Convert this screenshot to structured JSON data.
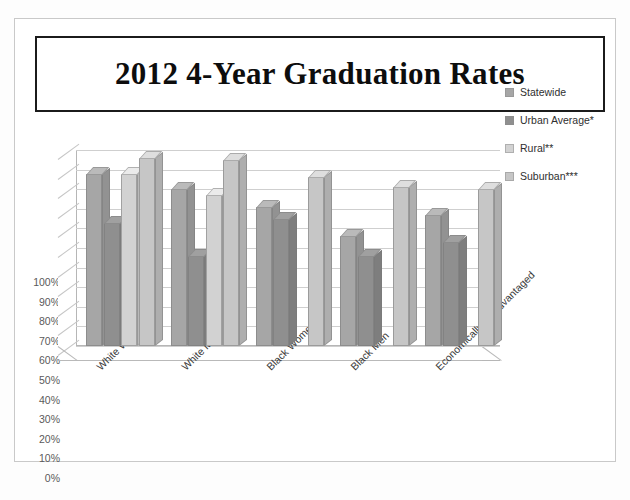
{
  "title": "2012 4-Year Graduation Rates",
  "legend": {
    "position": "right",
    "items": [
      {
        "label": "Statewide",
        "color": "#a6a6a6"
      },
      {
        "label": "Urban Average*",
        "color": "#8f8f8f"
      },
      {
        "label": "Rural**",
        "color": "#d2d2d2"
      },
      {
        "label": "Suburban***",
        "color": "#c6c6c6"
      }
    ]
  },
  "chart_data": {
    "type": "bar",
    "title": "2012 4-Year Graduation Rates",
    "xlabel": "",
    "ylabel": "",
    "ylim": [
      0,
      100
    ],
    "grid": true,
    "yticks": [
      "0%",
      "10%",
      "20%",
      "30%",
      "40%",
      "50%",
      "60%",
      "70%",
      "80%",
      "90%",
      "100%"
    ],
    "categories": [
      "White Women",
      "White Men",
      "Black Women",
      "Black Men",
      "Economically Disadvantaged"
    ],
    "series": [
      {
        "name": "Statewide",
        "color": "#a6a6a6",
        "values": [
          88,
          80,
          71,
          56,
          67
        ]
      },
      {
        "name": "Urban Average*",
        "color": "#8f8f8f",
        "values": [
          63,
          46,
          65,
          46,
          53
        ]
      },
      {
        "name": "Rural**",
        "color": "#d2d2d2",
        "values": [
          88,
          77,
          null,
          null,
          null
        ]
      },
      {
        "name": "Suburban***",
        "color": "#c6c6c6",
        "values": [
          96,
          95,
          86,
          81,
          80
        ]
      }
    ]
  }
}
